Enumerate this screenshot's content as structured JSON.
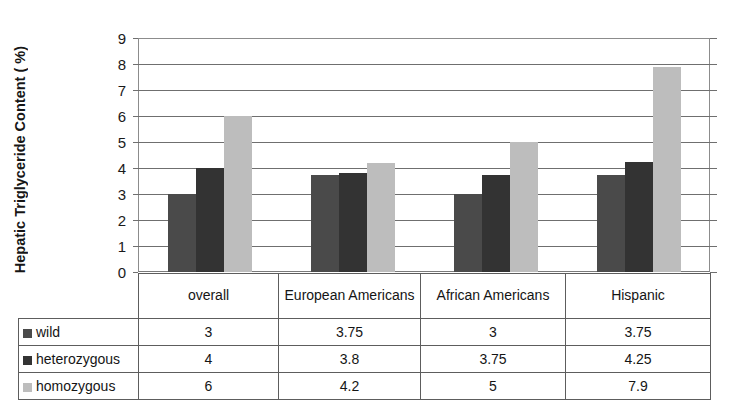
{
  "chart_data": {
    "type": "bar",
    "title": "",
    "subtitle": "",
    "xlabel": "",
    "ylabel": "Hepatic Triglyceride Content ( %)",
    "ylim": [
      0,
      9
    ],
    "ytick_step": 1,
    "yticks": [
      "9",
      "8",
      "7",
      "6",
      "5",
      "4",
      "3",
      "2",
      "1",
      "0"
    ],
    "grid": true,
    "legend_position": "table-row-headers",
    "categories": [
      "overall",
      "European Americans",
      "African Americans",
      "Hispanic"
    ],
    "series": [
      {
        "name": "wild",
        "color": "#4a4a4a",
        "values": [
          3,
          3.75,
          3,
          3.75
        ],
        "labels": [
          "3",
          "3.75",
          "3",
          "3.75"
        ]
      },
      {
        "name": "heterozygous",
        "color": "#333333",
        "values": [
          4,
          3.8,
          3.75,
          4.25
        ],
        "labels": [
          "4",
          "3.8",
          "3.75",
          "4.25"
        ]
      },
      {
        "name": "homozygous",
        "color": "#bdbdbd",
        "values": [
          6,
          4.2,
          5,
          7.9
        ],
        "labels": [
          "6",
          "4.2",
          "5",
          "7.9"
        ]
      }
    ]
  },
  "table": {
    "corner_label": "",
    "column_headers": [
      "overall",
      "European Americans",
      "African Americans",
      "Hispanic"
    ],
    "rows": [
      {
        "label": "wild",
        "swatch": "#4a4a4a",
        "values": [
          "3",
          "3.75",
          "3",
          "3.75"
        ]
      },
      {
        "label": "heterozygous",
        "swatch": "#333333",
        "values": [
          "4",
          "3.8",
          "3.75",
          "4.25"
        ]
      },
      {
        "label": "homozygous",
        "swatch": "#bdbdbd",
        "values": [
          "6",
          "4.2",
          "5",
          "7.9"
        ]
      }
    ]
  },
  "colors": {
    "wild": "#4a4a4a",
    "heterozygous": "#333333",
    "homozygous": "#bdbdbd",
    "gridline": "#6f6f6f",
    "frame": "#8c8c8c",
    "table_border": "#5d5d5d"
  }
}
